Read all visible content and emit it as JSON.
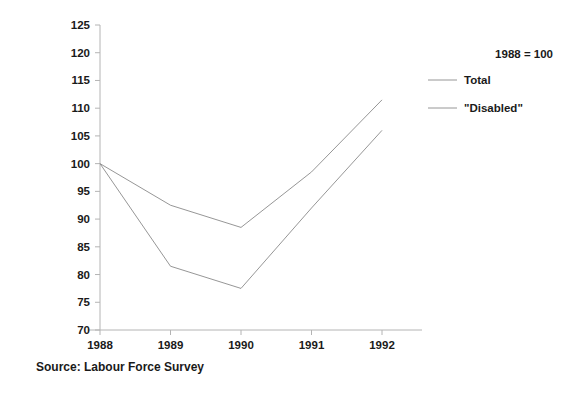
{
  "figure": {
    "source_caption": "Source: Labour Force Survey",
    "legend_title": "1988 = 100"
  },
  "axis": {
    "y_ticks": [
      "125",
      "120",
      "115",
      "110",
      "105",
      "100",
      "95",
      "90",
      "85",
      "80",
      "75",
      "70"
    ],
    "x_ticks": [
      "1988",
      "1989",
      "1990",
      "1991",
      "1992"
    ]
  },
  "legend": {
    "entries": [
      {
        "label": "Total",
        "color": "#8a8a8a"
      },
      {
        "label": "\"Disabled\"",
        "color": "#8a8a8a"
      }
    ]
  },
  "chart_data": {
    "type": "line",
    "title": "",
    "subtitle": "",
    "xlabel": "",
    "ylabel": "",
    "annotations": [
      "1988 = 100"
    ],
    "source": "Source: Labour Force Survey",
    "categories": [
      "1988",
      "1989",
      "1990",
      "1991",
      "1992"
    ],
    "x": [
      1988,
      1989,
      1990,
      1991,
      1992
    ],
    "ylim": [
      70,
      125
    ],
    "xlim": [
      1988,
      1992
    ],
    "y_tick_values": [
      70,
      75,
      80,
      85,
      90,
      95,
      100,
      105,
      110,
      115,
      120,
      125
    ],
    "y_tick_step": 5,
    "grid": false,
    "legend_position": "top-right",
    "series": [
      {
        "name": "Total",
        "color": "#8a8a8a",
        "values": [
          100,
          92.5,
          88.5,
          98.5,
          111.5
        ]
      },
      {
        "name": "\"Disabled\"",
        "color": "#8a8a8a",
        "values": [
          100,
          81.5,
          77.5,
          92.0,
          106.0
        ]
      }
    ]
  }
}
